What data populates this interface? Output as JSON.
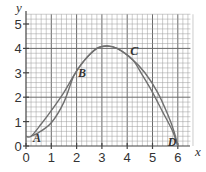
{
  "chart_data": {
    "type": "line",
    "title": "",
    "xlabel": "x",
    "ylabel": "y",
    "xlim": [
      0,
      6.5
    ],
    "ylim": [
      0,
      5.4
    ],
    "grid": true,
    "grid_minor_step": 0.2,
    "grid_major_step": 2,
    "x_ticks": [
      "0",
      "1",
      "2",
      "3",
      "4",
      "5",
      "6"
    ],
    "y_ticks": [
      "0",
      "1",
      "2",
      "3",
      "4",
      "5"
    ],
    "series": [
      {
        "name": "curve-1",
        "points": [
          [
            0.2,
            0.4
          ],
          [
            0.5,
            0.55
          ],
          [
            1,
            0.95
          ],
          [
            1.5,
            1.8
          ],
          [
            1.9,
            2.9
          ],
          [
            2.3,
            3.5
          ],
          [
            2.8,
            4.0
          ],
          [
            3.2,
            4.1
          ],
          [
            3.6,
            4.0
          ],
          [
            4.2,
            3.55
          ],
          [
            4.7,
            3.0
          ],
          [
            5.2,
            2.2
          ],
          [
            5.6,
            1.3
          ],
          [
            5.85,
            0.6
          ],
          [
            6,
            0
          ]
        ]
      },
      {
        "name": "curve-2",
        "points": [
          [
            0,
            0.4
          ],
          [
            0.2,
            0.4
          ],
          [
            0.6,
            0.9
          ],
          [
            1,
            1.45
          ],
          [
            1.5,
            2.2
          ],
          [
            1.9,
            2.9
          ],
          [
            2.3,
            3.5
          ],
          [
            2.8,
            4.0
          ],
          [
            3.2,
            4.1
          ],
          [
            3.6,
            4.0
          ],
          [
            4.2,
            3.55
          ],
          [
            4.6,
            2.9
          ],
          [
            5.0,
            2.2
          ],
          [
            5.4,
            1.4
          ],
          [
            5.8,
            0.6
          ],
          [
            6,
            0
          ]
        ]
      }
    ],
    "annotations": [
      {
        "label": "A",
        "x": 0.2,
        "y": 0.4
      },
      {
        "label": "B",
        "x": 1.9,
        "y": 2.9
      },
      {
        "label": "C",
        "x": 4.2,
        "y": 3.55
      },
      {
        "label": "D",
        "x": 6,
        "y": 0
      }
    ]
  }
}
